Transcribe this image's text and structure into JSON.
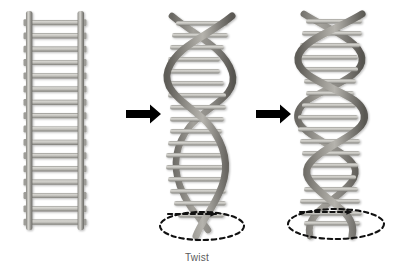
{
  "figure": {
    "title": "",
    "background_color": "#ffffff",
    "width": 394,
    "height": 276
  },
  "captions": {
    "twist_1": "Twist"
  },
  "colors": {
    "rail_dark": "#6f6e6a",
    "rail_mid": "#8d8c87",
    "rail_light": "#c9c8c3",
    "rung_light": "#d2d1cc",
    "rung_mid": "#b4b3ae",
    "rung_edge": "#8a8984",
    "strand_dark": "#6b6964",
    "strand_mid": "#8e8c86",
    "strand_light": "#b9b7b1",
    "arrow_black": "#000000",
    "dashed_black": "#111111",
    "caption_text": "#5b5b5b"
  },
  "panels": [
    {
      "id": "panel-ladder",
      "name": "straight-ladder",
      "label": "",
      "rung_count": 16,
      "twists": 0,
      "x": 20,
      "y": 10,
      "width": 70,
      "height": 220
    },
    {
      "id": "panel-helix-loose",
      "name": "double-helix-loose",
      "label": "Twist",
      "rung_count": 17,
      "twists": 2,
      "x": 165,
      "y": 8,
      "width": 78,
      "height": 228,
      "has_rotation_ellipse": true,
      "rotation_arrow_direction": "right"
    },
    {
      "id": "panel-helix-tight",
      "name": "double-helix-tight",
      "label": "",
      "rung_count": 18,
      "twists": 4,
      "x": 295,
      "y": 8,
      "width": 82,
      "height": 228,
      "has_rotation_ellipse": true,
      "rotation_arrow_direction": "right"
    }
  ],
  "arrows": [
    {
      "id": "arrow-1",
      "name": "transition-arrow-1",
      "from": "panel-ladder",
      "to": "panel-helix-loose",
      "x": 126,
      "y": 114,
      "length": 34,
      "direction": "right"
    },
    {
      "id": "arrow-2",
      "name": "transition-arrow-2",
      "from": "panel-helix-loose",
      "to": "panel-helix-tight",
      "x": 256,
      "y": 114,
      "length": 34,
      "direction": "right"
    }
  ],
  "rotation_markers": [
    {
      "id": "ellipse-1",
      "name": "rotation-ellipse-middle",
      "cx": 202,
      "cy": 226,
      "rx": 42,
      "ry": 14,
      "arrow": "dashed-right-arrow"
    },
    {
      "id": "ellipse-2",
      "name": "rotation-ellipse-right",
      "cx": 336,
      "cy": 224,
      "rx": 48,
      "ry": 15,
      "arrow": "dashed-right-arrow"
    }
  ]
}
